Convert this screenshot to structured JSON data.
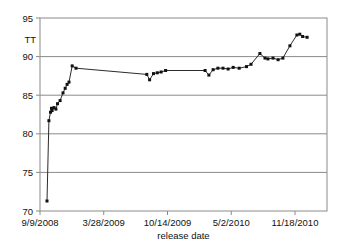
{
  "figure": {
    "background": "#ffffff",
    "frame_color": "#8a8a8a",
    "grid_color": "#8a8a8a",
    "line_color": "#2b2b2b",
    "marker_color": "#111111",
    "text_color": "#111111"
  },
  "chart_data": {
    "type": "line",
    "title": "",
    "ylabel": "TT",
    "xlabel": "release date",
    "x_unit": "days since 9/9/2008",
    "grid": "horizontal",
    "legend": "none",
    "marker": "square",
    "ylim": [
      70,
      95
    ],
    "xlim_days": [
      0,
      900
    ],
    "yticks": [
      70,
      75,
      80,
      85,
      90,
      95
    ],
    "xticks": {
      "days": [
        0,
        200,
        400,
        600,
        800
      ],
      "labels": [
        "9/9/2008",
        "3/28/2009",
        "10/14/2009",
        "5/2/2010",
        "11/18/2010"
      ]
    },
    "series": [
      {
        "name": "TT",
        "points": [
          [
            22,
            71.3
          ],
          [
            28,
            81.7
          ],
          [
            33,
            82.8
          ],
          [
            36,
            83.3
          ],
          [
            38,
            83.0
          ],
          [
            44,
            83.4
          ],
          [
            50,
            83.2
          ],
          [
            55,
            83.9
          ],
          [
            63,
            84.3
          ],
          [
            72,
            85.3
          ],
          [
            79,
            85.9
          ],
          [
            85,
            86.4
          ],
          [
            91,
            86.7
          ],
          [
            101,
            88.8
          ],
          [
            113,
            88.5
          ],
          [
            335,
            87.7
          ],
          [
            344,
            87.0
          ],
          [
            356,
            87.8
          ],
          [
            368,
            87.9
          ],
          [
            380,
            88.0
          ],
          [
            394,
            88.2
          ],
          [
            518,
            88.2
          ],
          [
            530,
            87.6
          ],
          [
            543,
            88.3
          ],
          [
            558,
            88.5
          ],
          [
            574,
            88.5
          ],
          [
            590,
            88.4
          ],
          [
            606,
            88.6
          ],
          [
            625,
            88.5
          ],
          [
            648,
            88.7
          ],
          [
            662,
            89.0
          ],
          [
            690,
            90.4
          ],
          [
            706,
            89.8
          ],
          [
            715,
            89.7
          ],
          [
            731,
            89.8
          ],
          [
            747,
            89.6
          ],
          [
            762,
            89.8
          ],
          [
            784,
            91.4
          ],
          [
            806,
            92.8
          ],
          [
            815,
            92.9
          ],
          [
            824,
            92.6
          ],
          [
            838,
            92.5
          ]
        ]
      }
    ]
  }
}
